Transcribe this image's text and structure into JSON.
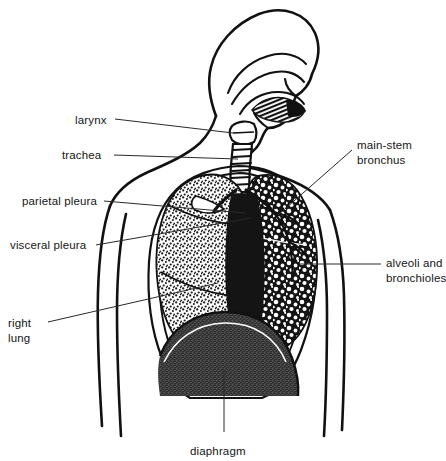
{
  "figure": {
    "width": 446,
    "height": 461,
    "background_color": "#ffffff",
    "ink_color": "#111111",
    "leader_line_color": "#2a2a2a"
  },
  "labels": {
    "larynx": {
      "text": "larynx",
      "x": 75,
      "y": 113,
      "align": "left"
    },
    "trachea": {
      "text": "trachea",
      "x": 62,
      "y": 148,
      "align": "left"
    },
    "parietal_pleura": {
      "text": "parietal pleura",
      "x": 22,
      "y": 194,
      "align": "left"
    },
    "visceral_pleura": {
      "text": "visceral pleura",
      "x": 10,
      "y": 238,
      "align": "left"
    },
    "right_lung_line1": {
      "text": "right",
      "x": 8,
      "y": 318,
      "align": "left"
    },
    "right_lung_line2": {
      "text": "lung",
      "x": 8,
      "y": 333,
      "align": "left"
    },
    "main_stem_line1": {
      "text": "main-stem",
      "x": 357,
      "y": 138,
      "align": "left"
    },
    "main_stem_line2": {
      "text": "bronchus",
      "x": 357,
      "y": 153,
      "align": "left"
    },
    "alveoli_line1": {
      "text": "alveoli and",
      "x": 386,
      "y": 256,
      "align": "left"
    },
    "alveoli_line2": {
      "text": "bronchioles",
      "x": 386,
      "y": 271,
      "align": "left"
    },
    "diaphragm": {
      "text": "diaphragm",
      "x": 190,
      "y": 444,
      "align": "left"
    }
  },
  "structures": {
    "head": "head and neck outline",
    "nasal_cavity": "nasal cavity",
    "oral_cavity": "oral cavity with tongue",
    "larynx": "larynx",
    "trachea": "trachea with cartilage rings",
    "right_lung": "right lung, stippled alveolar texture",
    "left_lung": "left lung, dark branching bronchial tree",
    "main_stem_bronchus": "main-stem bronchus",
    "parietal_pleura": "parietal pleura membrane",
    "visceral_pleura": "visceral pleura membrane",
    "diaphragm": "diaphragm dome",
    "torso": "torso and shoulder outline",
    "arms": "arm outlines"
  }
}
